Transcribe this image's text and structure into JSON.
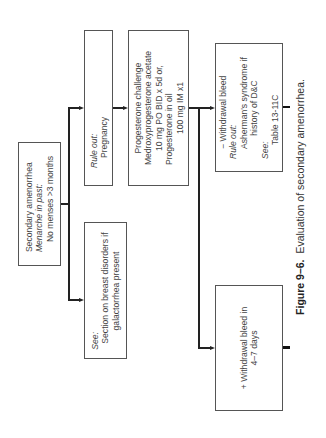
{
  "diagram": {
    "orientation": "rotated-90-ccw",
    "nodes": {
      "start": {
        "lines": [
          {
            "text": "Secondary amenorrhea",
            "style": "normal"
          },
          {
            "text": "Menarche in past:",
            "style": "italic"
          },
          {
            "text": "No menses >3 months",
            "style": "indent"
          }
        ]
      },
      "rule_out_pregnancy": {
        "lines": [
          {
            "text": "Rule out:",
            "style": "italic"
          },
          {
            "text": "Pregnancy",
            "style": "indent"
          }
        ]
      },
      "see_breast": {
        "lines": [
          {
            "text": "See:",
            "style": "italic"
          },
          {
            "text": "Section on breast disorders if",
            "style": "indent"
          },
          {
            "text": "galactorrhea present",
            "style": "center"
          }
        ]
      },
      "progesterone_challenge": {
        "lines": [
          {
            "text": "Progesterone challenge",
            "style": "center"
          },
          {
            "text": "Medroxyprogesterone acetate",
            "style": "center"
          },
          {
            "text": "10 mg PO BID x 5d or,",
            "style": "center"
          },
          {
            "text": "Progesterone in oil",
            "style": "left"
          },
          {
            "text": "100 mg IM x1",
            "style": "center"
          }
        ]
      },
      "negative_withdrawal": {
        "lines": [
          {
            "text": "− Withdrawal bleed",
            "style": "indent"
          },
          {
            "text": "Rule out:",
            "style": "italic"
          },
          {
            "text": "Asherman's syndrome if",
            "style": "indent"
          },
          {
            "text": "history of D&C",
            "style": "center"
          },
          {
            "text": "See:",
            "style": "italic"
          },
          {
            "text": "Table 13-11C",
            "style": "indent2"
          }
        ]
      },
      "positive_withdrawal": {
        "lines": [
          {
            "text": "+ Withdrawal bleed in",
            "style": "left"
          },
          {
            "text": "4–7 days",
            "style": "center"
          }
        ]
      }
    },
    "edges": [
      {
        "from": "start",
        "to": "rule_out_pregnancy"
      },
      {
        "from": "start",
        "to": "see_breast"
      },
      {
        "from": "rule_out_pregnancy",
        "to": "progesterone_challenge"
      },
      {
        "from": "progesterone_challenge",
        "to": "negative_withdrawal"
      },
      {
        "from": "progesterone_challenge",
        "to": "positive_withdrawal"
      }
    ]
  },
  "caption": {
    "figure_label": "Figure 9–6.",
    "text": "Evaluation of secondary amenorrhea."
  },
  "colors": {
    "line": "#222222",
    "box_border": "#555555",
    "text": "#444444"
  }
}
